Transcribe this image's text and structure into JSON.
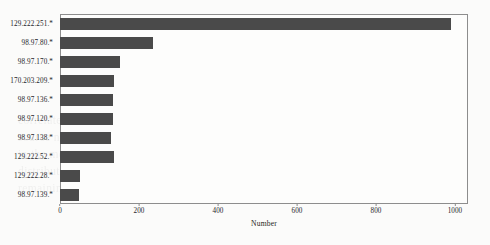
{
  "chart_data": {
    "type": "bar",
    "orientation": "horizontal",
    "title": "",
    "xlabel": "Number",
    "ylabel": "",
    "xlim": [
      0,
      1033
    ],
    "xticks": [
      0,
      200,
      400,
      600,
      800,
      1000
    ],
    "xtick_labels": [
      "0",
      "200",
      "400",
      "600",
      "800",
      "1000"
    ],
    "grid": false,
    "legend": false,
    "bar_color": "#4a4a4a",
    "frame_color": "#8d8d8d",
    "background_color": "#fdfdfc",
    "categories": [
      "129.222.251.*",
      "98.97.80.*",
      "98.97.170.*",
      "170.203.209.*",
      "98.97.136.*",
      "98.97.120.*",
      "98.97.138.*",
      "129.222.52.*",
      "129.222.28.*",
      "98.97.139.*"
    ],
    "values": [
      990,
      235,
      152,
      137,
      133,
      133,
      130,
      137,
      50,
      48
    ]
  },
  "bleed_text": {
    "lines": [
      "correlated with the observed scanning activity of these",
      "source networks and the aggregated probe counts",
      "in the measurement interval reported below, the",
      "distribution is dominated by a single prefix while the",
      "remaining sources contribute comparable volumes"
    ]
  }
}
